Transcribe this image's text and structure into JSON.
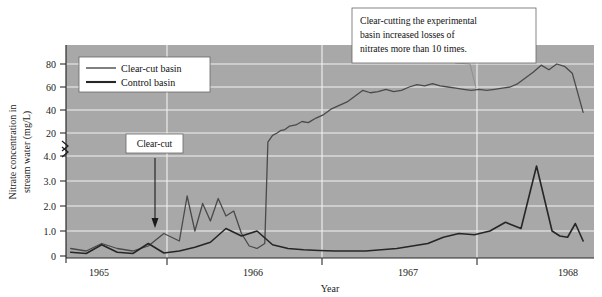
{
  "chart_data": {
    "type": "line",
    "title": "",
    "xlabel": "Year",
    "ylabel": "Nitrate concentration in stream water (mg/L)",
    "grid": true,
    "legend_position": "top-left",
    "broken_axis": true,
    "axis_break_note": "y-axis is broken between 4.0 and 20; lower segment 0-4.0 in 1.0 steps, upper segment 20-80 in 20 steps",
    "x_ticks": [
      "1965",
      "1966",
      "1967",
      "1968"
    ],
    "xlim": [
      1964.72,
      1968.12
    ],
    "y_ticks_lower": [
      "0",
      "1.0",
      "2.0",
      "3.0",
      "4.0"
    ],
    "y_ticks_upper": [
      "20",
      "40",
      "60",
      "80"
    ],
    "ylim_lower": [
      0,
      4.0
    ],
    "ylim_upper": [
      20,
      90
    ],
    "series": [
      {
        "name": "Clear-cut basin",
        "color": "#4a4a4a",
        "x": [
          1964.75,
          1964.85,
          1964.95,
          1965.05,
          1965.15,
          1965.25,
          1965.35,
          1965.45,
          1965.5,
          1965.55,
          1965.6,
          1965.65,
          1965.7,
          1965.75,
          1965.8,
          1965.85,
          1965.9,
          1965.95,
          1966.0,
          1966.02,
          1966.05,
          1966.08,
          1966.1,
          1966.13,
          1966.16,
          1966.2,
          1966.24,
          1966.28,
          1966.33,
          1966.38,
          1966.43,
          1966.48,
          1966.53,
          1966.58,
          1966.63,
          1966.68,
          1966.73,
          1966.78,
          1966.83,
          1966.88,
          1966.93,
          1966.98,
          1967.03,
          1967.08,
          1967.13,
          1967.18,
          1967.23,
          1967.28,
          1967.33,
          1967.38,
          1967.43,
          1967.48,
          1967.53,
          1967.58,
          1967.63,
          1967.68,
          1967.73,
          1967.78,
          1967.83,
          1967.88,
          1967.93,
          1967.98,
          1968.05
        ],
        "y": [
          0.3,
          0.2,
          0.5,
          0.3,
          0.2,
          0.4,
          0.9,
          0.6,
          2.4,
          1.0,
          2.1,
          1.4,
          2.3,
          1.6,
          1.8,
          0.9,
          0.4,
          0.3,
          0.5,
          12,
          18,
          20,
          22,
          23,
          26,
          27,
          30,
          29,
          33,
          36,
          41,
          44,
          47,
          52,
          57,
          55,
          56,
          58,
          56,
          57,
          60,
          62,
          61,
          63,
          61,
          60,
          59,
          58,
          57,
          58,
          57,
          58,
          59,
          60,
          63,
          68,
          73,
          79,
          75,
          80,
          78,
          72,
          38
        ],
        "note": "values below the axis break (before clear-cut) are in the 0-4 mg/L lower scale; after the clear-cut the line rises into the 20-80 mg/L upper scale"
      },
      {
        "name": "Control basin",
        "color": "#262626",
        "x": [
          1964.75,
          1964.85,
          1964.95,
          1965.05,
          1965.15,
          1965.25,
          1965.35,
          1965.45,
          1965.55,
          1965.65,
          1965.75,
          1965.85,
          1965.95,
          1966.05,
          1966.15,
          1966.25,
          1966.35,
          1966.45,
          1966.55,
          1966.65,
          1966.75,
          1966.85,
          1966.95,
          1967.05,
          1967.15,
          1967.25,
          1967.35,
          1967.45,
          1967.55,
          1967.65,
          1967.75,
          1967.85,
          1967.9,
          1967.95,
          1968.0,
          1968.05
        ],
        "y": [
          0.15,
          0.1,
          0.45,
          0.15,
          0.1,
          0.5,
          0.12,
          0.2,
          0.35,
          0.55,
          1.1,
          0.8,
          1.0,
          0.45,
          0.3,
          0.25,
          0.22,
          0.2,
          0.2,
          0.2,
          0.25,
          0.3,
          0.4,
          0.5,
          0.75,
          0.9,
          0.85,
          1.0,
          1.35,
          1.1,
          3.6,
          1.0,
          0.8,
          0.75,
          1.3,
          0.6
        ]
      }
    ],
    "annotations": [
      {
        "id": "clear-cut-marker",
        "text": "Clear-cut",
        "arrow": "down",
        "points_to_year": 1965.58
      },
      {
        "id": "callout",
        "text": "Clear-cutting the experimental basin increased losses of nitrates more than 10 times.",
        "lines": [
          "Clear-cutting the experimental",
          "basin increased losses of",
          "nitrates more than 10 times."
        ]
      }
    ],
    "colors": {
      "plot_background": "#a8a8a8",
      "gridline": "#f2f2f2",
      "axis": "#2b2b2b",
      "page_background": "#ffffff"
    }
  },
  "ylabel_lines": [
    "Nitrate concentration in",
    "stream water (mg/L)"
  ],
  "legend": {
    "items": [
      {
        "label": "Clear-cut basin",
        "swatch": "thin-line-swatch"
      },
      {
        "label": "Control basin",
        "swatch": "thick-line-swatch"
      }
    ]
  },
  "axis": {
    "x_title": "Year",
    "x_ticks": [
      "1965",
      "1966",
      "1967",
      "1968"
    ],
    "y_ticks": [
      "80",
      "60",
      "40",
      "20",
      "4.0",
      "3.0",
      "2.0",
      "1.0",
      "0"
    ],
    "break_symbol": "axis-break-icon"
  },
  "annotations": {
    "clearcut_label": "Clear-cut",
    "callout_line1": "Clear-cutting the experimental",
    "callout_line2": "basin increased losses of",
    "callout_line3": "nitrates more than 10 times."
  }
}
